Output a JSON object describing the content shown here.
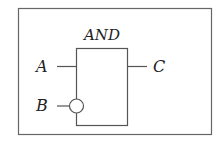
{
  "diagram": {
    "type": "logic-gate",
    "gate": {
      "name": "AND",
      "label": "AND"
    },
    "inputs": [
      {
        "label": "A",
        "inverted": false
      },
      {
        "label": "B",
        "inverted": true
      }
    ],
    "outputs": [
      {
        "label": "C"
      }
    ],
    "colors": {
      "stroke": "#555555",
      "text": "#222222",
      "background": "#ffffff"
    }
  }
}
